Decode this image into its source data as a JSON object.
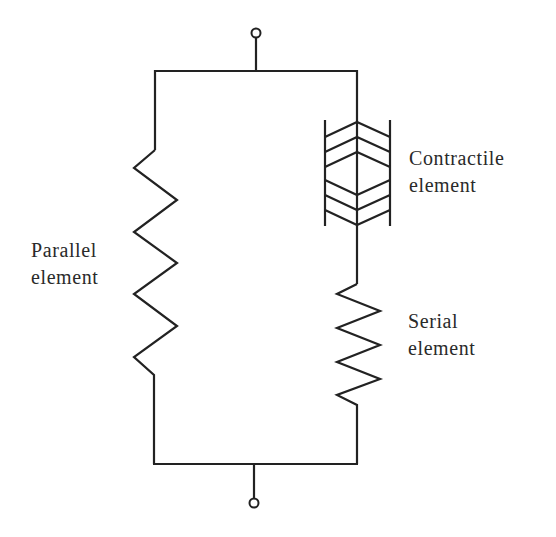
{
  "diagram": {
    "type": "Hill-type muscle model (circuit-style)",
    "colors": {
      "line": "#222222",
      "text": "#2a2a2a",
      "background": "#ffffff"
    },
    "labels": {
      "parallel": {
        "line1": "Parallel",
        "line2": "element"
      },
      "contractile": {
        "line1": "Contractile",
        "line2": "element"
      },
      "serial": {
        "line1": "Serial",
        "line2": "element"
      }
    },
    "components": [
      {
        "id": "top-terminal",
        "kind": "terminal"
      },
      {
        "id": "bottom-terminal",
        "kind": "terminal"
      },
      {
        "id": "parallel-element",
        "kind": "spring",
        "branch": "left"
      },
      {
        "id": "contractile-element",
        "kind": "contractile",
        "branch": "right"
      },
      {
        "id": "serial-element",
        "kind": "spring",
        "branch": "right"
      }
    ],
    "connections": [
      "top-terminal -> top-bus",
      "top-bus -> parallel-element -> bottom-bus",
      "top-bus -> contractile-element -> serial-element -> bottom-bus",
      "bottom-bus -> bottom-terminal"
    ]
  }
}
